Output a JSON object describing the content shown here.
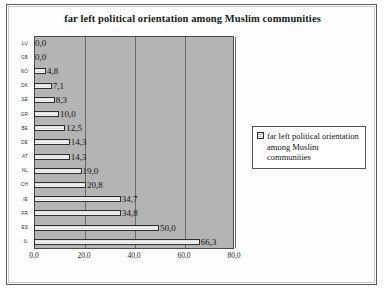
{
  "chart_data": {
    "type": "bar",
    "orientation": "horizontal",
    "title": "far left political orientation among Muslim communities",
    "xlabel": "",
    "ylabel": "",
    "categories": [
      "LU",
      "GB",
      "NO",
      "DK",
      "SE",
      "GR",
      "BE",
      "DE",
      "AT",
      "NL",
      "CH",
      "IE",
      "FR",
      "ES",
      "IL"
    ],
    "values": [
      0.0,
      0.0,
      4.8,
      7.1,
      8.3,
      10.0,
      12.5,
      14.3,
      14.3,
      19.0,
      20.8,
      34.7,
      34.8,
      50.0,
      66.3
    ],
    "data_labels": [
      "0,0",
      "0,0",
      "4,8",
      "7,1",
      "8,3",
      "10,0",
      "12,5",
      "14,3",
      "14,3",
      "19,0",
      "20,8",
      "34,7",
      "34,8",
      "50,0",
      "66,3"
    ],
    "xlim": [
      0.0,
      80.0
    ],
    "xticks": [
      0.0,
      20.0,
      40.0,
      60.0,
      80.0
    ],
    "xtick_labels": [
      "0,0",
      "20,0",
      "40,0",
      "60,0",
      "80,0"
    ],
    "grid": true,
    "grid_axis": "x",
    "legend_position": "right",
    "series": [
      {
        "name": "far left political orientation among Muslim communities",
        "values": [
          0.0,
          0.0,
          4.8,
          7.1,
          8.3,
          10.0,
          12.5,
          14.3,
          14.3,
          19.0,
          20.8,
          34.7,
          34.8,
          50.0,
          66.3
        ]
      }
    ],
    "colors": {
      "plot_background": "#b4b4b4",
      "bar_fill": "#f2f2f2",
      "bar_border": "#2e2e2e",
      "gridline": "#6a6a6a",
      "text": "#151515"
    }
  },
  "legend": {
    "entries": [
      {
        "label": "far left political orientation among Muslim communities"
      }
    ]
  }
}
